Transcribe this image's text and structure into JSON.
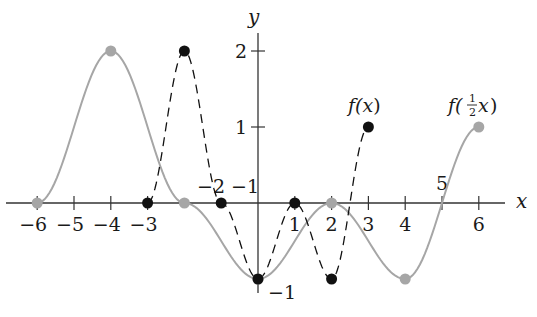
{
  "chart_data": {
    "type": "line",
    "title": "",
    "xlabel": "x",
    "ylabel": "y",
    "xlim": [
      -6.5,
      7
    ],
    "ylim": [
      -1.3,
      2.4
    ],
    "grid": false,
    "x_ticks": [
      -6,
      -5,
      -4,
      -3,
      -2,
      -1,
      1,
      2,
      3,
      4,
      5,
      6
    ],
    "y_ticks": [
      -1,
      1,
      2
    ],
    "x_tick_labels": [
      "−6",
      "−5",
      "−4",
      "−3",
      "−2",
      "−1",
      "1",
      "2",
      "3",
      "4",
      "5",
      "6"
    ],
    "y_tick_labels": [
      "−1",
      "1",
      "2"
    ],
    "series": [
      {
        "name": "f(x)",
        "style": "dashed",
        "color": "#111111",
        "points": [
          [
            -3,
            0
          ],
          [
            -2,
            2
          ],
          [
            -1,
            0
          ],
          [
            0,
            -1
          ],
          [
            1,
            0
          ],
          [
            2,
            -1
          ],
          [
            3,
            1
          ]
        ]
      },
      {
        "name": "f(½x)",
        "style": "solid",
        "color": "#a6a6a6",
        "points": [
          [
            -6,
            0
          ],
          [
            -4,
            2
          ],
          [
            -2,
            0
          ],
          [
            0,
            -1
          ],
          [
            2,
            0
          ],
          [
            4,
            -1
          ],
          [
            6,
            1
          ]
        ]
      }
    ],
    "annotations": [
      {
        "text": "f(x)",
        "at": [
          3,
          1
        ],
        "position": "above"
      },
      {
        "text": "f(½x)",
        "at": [
          6,
          1
        ],
        "position": "above"
      }
    ]
  },
  "labels": {
    "x_axis": "x",
    "y_axis": "y",
    "f_label_prefix": "f(",
    "f_label_var": "x",
    "f_label_suffix": ")",
    "g_label_prefix": "f(",
    "g_label_num": "1",
    "g_label_den": "2",
    "g_label_var": "x",
    "g_label_suffix": ")"
  }
}
